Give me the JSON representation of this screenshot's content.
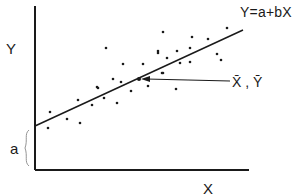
{
  "chart_data": {
    "type": "scatter",
    "title": "",
    "xlabel": "X",
    "ylabel": "Y",
    "grid": false,
    "legend": null,
    "series": [
      {
        "name": "observations",
        "points": [
          [
            50,
            112
          ],
          [
            48,
            128
          ],
          [
            67,
            119
          ],
          [
            78,
            100
          ],
          [
            80,
            123
          ],
          [
            92,
            105
          ],
          [
            98,
            88
          ],
          [
            104,
            98
          ],
          [
            97,
            87
          ],
          [
            106,
            48
          ],
          [
            113,
            79
          ],
          [
            117,
            103
          ],
          [
            121,
            82
          ],
          [
            123,
            64
          ],
          [
            131,
            91
          ],
          [
            143,
            64
          ],
          [
            148,
            86
          ],
          [
            158,
            51
          ],
          [
            158,
            53
          ],
          [
            162,
            73
          ],
          [
            163,
            32
          ],
          [
            163,
            73
          ],
          [
            167,
            58
          ],
          [
            176,
            89
          ],
          [
            177,
            51
          ],
          [
            180,
            63
          ],
          [
            190,
            48
          ],
          [
            190,
            62
          ],
          [
            192,
            37
          ],
          [
            208,
            39
          ],
          [
            217,
            54
          ],
          [
            221,
            60
          ],
          [
            227,
            28
          ]
        ]
      }
    ],
    "regression_line": {
      "equation": "Y=a+bX",
      "from": [
        35,
        126
      ],
      "to": [
        243,
        30
      ]
    },
    "mean_point": {
      "label": "X̄ , Ȳ",
      "at": [
        139,
        79
      ]
    },
    "intercept_label": "a",
    "annotations": [
      "Y=a+bX",
      "X̄ , Ȳ",
      "a"
    ]
  },
  "labels": {
    "y_axis": "Y",
    "x_axis": "X",
    "equation": "Y=a+bX",
    "mean": "X̄ , Ȳ",
    "intercept": "a"
  },
  "colors": {
    "ink": "#1a1a1a",
    "background": "#ffffff"
  }
}
